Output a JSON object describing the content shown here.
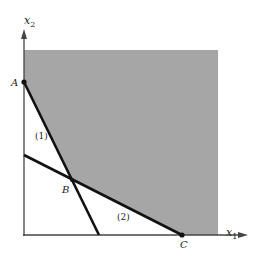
{
  "diagram": {
    "type": "feasible-region",
    "axes": {
      "x_label_base": "x",
      "x_label_sub": "1",
      "y_label_base": "x",
      "y_label_sub": "2"
    },
    "constraints": [
      {
        "label": "(1)"
      },
      {
        "label": "(2)"
      }
    ],
    "vertices": [
      {
        "label": "A"
      },
      {
        "label": "B"
      },
      {
        "label": "C"
      }
    ],
    "region": {
      "fill": "#a6a6a6",
      "description": "unbounded feasible region above constraints (1) and (2)"
    },
    "colors": {
      "line": "#111111",
      "axis": "#444444"
    }
  }
}
